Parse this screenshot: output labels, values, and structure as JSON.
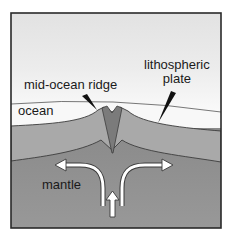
{
  "diagram": {
    "type": "cross-section",
    "labels": {
      "mid_ocean_ridge": "mid-ocean ridge",
      "lithospheric_plate_line1": "lithospheric",
      "lithospheric_plate_line2": "plate",
      "ocean": "ocean",
      "mantle": "mantle"
    },
    "layers": [
      {
        "name": "sky",
        "color": "#e4e4e4"
      },
      {
        "name": "ocean",
        "color": "#f7f7f7"
      },
      {
        "name": "lithospheric-plate",
        "color": "#a8a8a8"
      },
      {
        "name": "ridge-rift",
        "color": "#7c7c7c"
      },
      {
        "name": "mantle",
        "color": "#8e8e8e"
      }
    ],
    "arrows": [
      {
        "name": "mantle-flow-left",
        "direction": "up-then-left"
      },
      {
        "name": "mantle-flow-right",
        "direction": "up-then-right"
      },
      {
        "name": "mantle-upwelling",
        "direction": "up"
      }
    ],
    "colors": {
      "frame": "#2a2a2a",
      "outline": "#3c3c3c",
      "arrow_fill": "#ffffff"
    }
  }
}
